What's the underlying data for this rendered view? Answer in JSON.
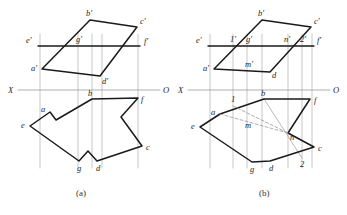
{
  "figure": {
    "captions": {
      "a": "(a)",
      "b": "(b)"
    },
    "colors": {
      "stroke_heavy": "#1a1a1a",
      "stroke_thin": "#8c8c8c",
      "stroke_dashed": "#9a9a9a",
      "background": "#ffffff",
      "label_color": "#262626"
    },
    "axis": {
      "x_label": "X",
      "o_label": "O"
    }
  },
  "panel_a": {
    "name": "(a)",
    "axis": {
      "x_label": "X",
      "o_label": "O",
      "y": 90,
      "x_start": 18,
      "x_end": 160
    },
    "ground_line": {
      "label_left": "e'",
      "label_right": "f'",
      "y": 46,
      "x_start": 38,
      "x_end": 140
    },
    "vertical_projectors": [
      40,
      78,
      92,
      102,
      138
    ],
    "upper_view_label": "front view",
    "lower_view_label": "top view",
    "points_upper": [
      {
        "id": "bp",
        "label": "b'",
        "x": 90,
        "y": 20,
        "label_dx": -4,
        "label_dy": -4
      },
      {
        "id": "cp",
        "label": "c'",
        "x": 137,
        "y": 27,
        "label_dx": 3,
        "label_dy": -3
      },
      {
        "id": "ep",
        "label": "e'",
        "x": 38,
        "y": 46,
        "label_dx": -12,
        "label_dy": -3
      },
      {
        "id": "gp",
        "label": "g'",
        "x": 78,
        "y": 46,
        "label_dx": -2,
        "label_dy": -4
      },
      {
        "id": "fp",
        "label": "f'",
        "x": 140,
        "y": 46,
        "label_dx": 4,
        "label_dy": -2
      },
      {
        "id": "ap",
        "label": "a'",
        "x": 42,
        "y": 69,
        "label_dx": -11,
        "label_dy": 2
      },
      {
        "id": "dp",
        "label": "d'",
        "x": 100,
        "y": 76,
        "label_dx": 2,
        "label_dy": 8
      }
    ],
    "points_lower": [
      {
        "id": "b",
        "label": "b",
        "x": 92,
        "y": 99,
        "label_dx": -4,
        "label_dy": -3
      },
      {
        "id": "f",
        "label": "f",
        "x": 138,
        "y": 98,
        "label_dx": 3,
        "label_dy": 4
      },
      {
        "id": "a",
        "label": "a",
        "x": 50,
        "y": 112,
        "label_dx": -9,
        "label_dy": 0
      },
      {
        "id": "e",
        "label": "e",
        "x": 30,
        "y": 126,
        "label_dx": -9,
        "label_dy": 2
      },
      {
        "id": "c",
        "label": "c",
        "x": 142,
        "y": 146,
        "label_dx": 4,
        "label_dy": 4
      },
      {
        "id": "g",
        "label": "g",
        "x": 79,
        "y": 161,
        "label_dx": -2,
        "label_dy": 10
      },
      {
        "id": "d",
        "label": "d",
        "x": 97,
        "y": 161,
        "label_dx": -1,
        "label_dy": 10
      }
    ],
    "upper_polygon": [
      [
        42,
        69
      ],
      [
        90,
        20
      ],
      [
        137,
        27
      ],
      [
        100,
        76
      ]
    ],
    "lower_polygon": [
      [
        92,
        99
      ],
      [
        138,
        98
      ],
      [
        121,
        117
      ],
      [
        142,
        146
      ],
      [
        97,
        161
      ],
      [
        88,
        151
      ],
      [
        79,
        161
      ],
      [
        30,
        126
      ],
      [
        50,
        112
      ],
      [
        56,
        120
      ]
    ]
  },
  "panel_b": {
    "name": "(b)",
    "axis": {
      "x_label": "X",
      "o_label": "O",
      "y": 90,
      "x_start": 188,
      "x_end": 330
    },
    "ground_line": {
      "label_left": "e'",
      "label_right": "f'",
      "y": 46,
      "x_start": 208,
      "x_end": 314
    },
    "vertical_projectors": [
      210,
      233,
      247,
      262,
      288,
      302,
      312
    ],
    "points_upper": [
      {
        "id": "bp",
        "label": "b'",
        "x": 262,
        "y": 20,
        "label_dx": -4,
        "label_dy": -4
      },
      {
        "id": "cp",
        "label": "c'",
        "x": 311,
        "y": 27,
        "label_dx": 3,
        "label_dy": -3
      },
      {
        "id": "ep",
        "label": "e'",
        "x": 208,
        "y": 46,
        "label_dx": -12,
        "label_dy": -3
      },
      {
        "id": "1p",
        "label": "1'",
        "x": 233,
        "y": 46,
        "label_dx": -3,
        "label_dy": -4
      },
      {
        "id": "gp",
        "label": "g'",
        "x": 247,
        "y": 46,
        "label_dx": -1,
        "label_dy": -4
      },
      {
        "id": "np",
        "label": "n'",
        "x": 288,
        "y": 46,
        "label_dx": -4,
        "label_dy": -4
      },
      {
        "id": "2p",
        "label": "2'",
        "x": 302,
        "y": 46,
        "label_dx": -2,
        "label_dy": -4
      },
      {
        "id": "fp",
        "label": "f'",
        "x": 314,
        "y": 46,
        "label_dx": 3,
        "label_dy": -3
      },
      {
        "id": "mp",
        "label": "m'",
        "x": 247,
        "y": 60,
        "label_dx": -2,
        "label_dy": 7
      },
      {
        "id": "ap",
        "label": "a'",
        "x": 214,
        "y": 69,
        "label_dx": -11,
        "label_dy": 2
      },
      {
        "id": "dp",
        "label": "d",
        "x": 270,
        "y": 72,
        "label_dx": 2,
        "label_dy": 6
      }
    ],
    "points_lower": [
      {
        "id": "b",
        "label": "b",
        "x": 264,
        "y": 99,
        "label_dx": -3,
        "label_dy": -3
      },
      {
        "id": "1",
        "label": "1",
        "x": 233,
        "y": 106,
        "label_dx": -2,
        "label_dy": -4
      },
      {
        "id": "f",
        "label": "f",
        "x": 310,
        "y": 99,
        "label_dx": 4,
        "label_dy": 4
      },
      {
        "id": "a",
        "label": "a",
        "x": 220,
        "y": 114,
        "label_dx": -9,
        "label_dy": 1
      },
      {
        "id": "m",
        "label": "m",
        "x": 247,
        "y": 119,
        "label_dx": -2,
        "label_dy": 9
      },
      {
        "id": "e",
        "label": "e",
        "x": 200,
        "y": 127,
        "label_dx": -9,
        "label_dy": 2
      },
      {
        "id": "n",
        "label": "n",
        "x": 288,
        "y": 133,
        "label_dx": 2,
        "label_dy": 7
      },
      {
        "id": "c",
        "label": "c",
        "x": 314,
        "y": 147,
        "label_dx": 4,
        "label_dy": 4
      },
      {
        "id": "g",
        "label": "g",
        "x": 252,
        "y": 162,
        "label_dx": -2,
        "label_dy": 10
      },
      {
        "id": "d",
        "label": "d",
        "x": 270,
        "y": 161,
        "label_dx": -1,
        "label_dy": 10
      },
      {
        "id": "2",
        "label": "2",
        "x": 302,
        "y": 158,
        "label_dx": -2,
        "label_dy": 9
      }
    ],
    "upper_polygon": [
      [
        214,
        69
      ],
      [
        262,
        20
      ],
      [
        311,
        27
      ],
      [
        270,
        72
      ]
    ],
    "lower_polygon_main": [
      [
        264,
        99
      ],
      [
        310,
        99
      ],
      [
        288,
        133
      ],
      [
        314,
        147
      ],
      [
        270,
        161
      ],
      [
        252,
        162
      ],
      [
        200,
        127
      ],
      [
        220,
        114
      ]
    ],
    "dashed_lines": [
      {
        "from": [
          220,
          114
        ],
        "to": [
          288,
          133
        ]
      },
      {
        "from": [
          233,
          106
        ],
        "to": [
          288,
          133
        ]
      }
    ],
    "thin_aux_lines": [
      {
        "from": [
          264,
          99
        ],
        "to": [
          302,
          158
        ]
      }
    ]
  }
}
